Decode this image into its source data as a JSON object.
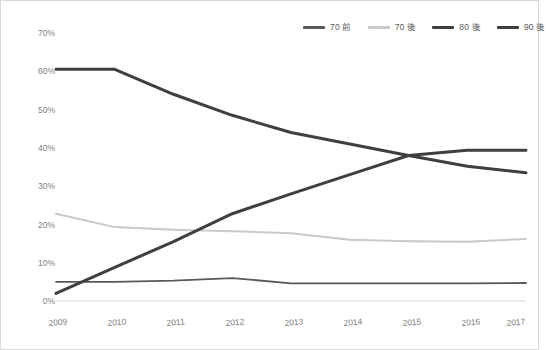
{
  "chart_data": {
    "type": "line",
    "title": "",
    "subtitle": "",
    "xlabel": "",
    "ylabel": "",
    "grid": false,
    "legend_position": "top-right",
    "categories": [
      "2009",
      "2010",
      "2011",
      "2012",
      "2013",
      "2014",
      "2015",
      "2016",
      "2017"
    ],
    "x": [
      2009,
      2010,
      2011,
      2012,
      2013,
      2014,
      2015,
      2016,
      2017
    ],
    "xlim": [
      2009,
      2017
    ],
    "ylim": [
      0,
      70
    ],
    "ytick_labels": [
      "70%",
      "60%",
      "50%",
      "40%",
      "30%",
      "20%",
      "10%",
      "0%"
    ],
    "ytick_values": [
      70,
      60,
      50,
      40,
      30,
      20,
      10,
      0
    ],
    "yaxis_unit": "%",
    "series": [
      {
        "name": "70 前",
        "color": "#595959",
        "values": [
          5.0,
          5.0,
          5.3,
          6.0,
          4.6,
          4.6,
          4.6,
          4.6,
          4.7
        ]
      },
      {
        "name": "70 後",
        "color": "#c9c9c9",
        "values": [
          22.8,
          19.3,
          18.6,
          18.2,
          17.7,
          16.0,
          15.6,
          15.5,
          16.2
        ]
      },
      {
        "name": "80 後",
        "color": "#3f3f3f",
        "values": [
          60.5,
          60.5,
          54.0,
          48.5,
          44.0,
          41.0,
          38.0,
          35.2,
          33.5
        ]
      },
      {
        "name": "90 後",
        "color": "#3f3f3f",
        "values": [
          2.0,
          8.8,
          15.5,
          22.8,
          28.0,
          33.0,
          38.0,
          39.4,
          39.4
        ]
      }
    ]
  },
  "legend": {
    "items": [
      {
        "label": "70 前",
        "color": "#595959",
        "icon": "line-swatch-icon"
      },
      {
        "label": "70 後",
        "color": "#c9c9c9",
        "icon": "line-swatch-icon"
      },
      {
        "label": "80 後",
        "color": "#3f3f3f",
        "icon": "line-swatch-icon"
      },
      {
        "label": "90 後",
        "color": "#3f3f3f",
        "icon": "line-swatch-icon"
      }
    ]
  },
  "axes": {
    "y_labels": [
      "70%",
      "60%",
      "50%",
      "40%",
      "30%",
      "20%",
      "10%",
      "0%"
    ],
    "x_labels": [
      "2009",
      "2010",
      "2011",
      "2012",
      "2013",
      "2014",
      "2015",
      "2016",
      "2017"
    ],
    "axis_color": "#d9d9d9",
    "label_color": "#808080"
  }
}
